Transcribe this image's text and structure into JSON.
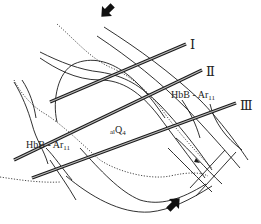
{
  "diagram": {
    "type": "geological-sketch-map",
    "colors": {
      "line": "#1a1a1a",
      "background": "#ffffff",
      "rail": "#555555"
    },
    "profiles": [
      {
        "id": "I",
        "label": "Ⅰ"
      },
      {
        "id": "II",
        "label": "Ⅱ"
      },
      {
        "id": "III",
        "label": "Ⅲ"
      }
    ],
    "labels": {
      "unit_right": {
        "main": "HbB - Ar",
        "sub": "11"
      },
      "unit_left": {
        "main": "HbB - Ar",
        "sub": "11"
      },
      "unit_center": {
        "prefix": "al",
        "main": "Q",
        "sub": "4"
      }
    },
    "arrows": [
      {
        "name": "stress-arrow-top",
        "direction": "down-right"
      },
      {
        "name": "stress-arrow-bottom",
        "direction": "up-left"
      }
    ]
  }
}
